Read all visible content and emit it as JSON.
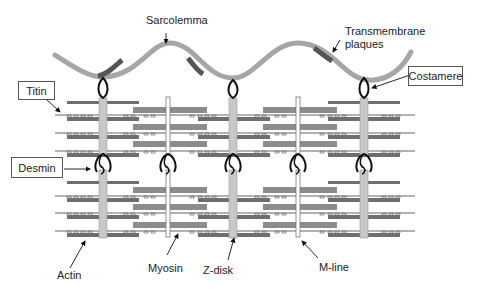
{
  "diagram": {
    "type": "muscle-sarcomere-cytoskeleton",
    "labels": {
      "sarcolemma": "Sarcolemma",
      "transmembrane": "Transmembrane",
      "plaques": "plaques",
      "costamere": "Costamere",
      "titin": "Titin",
      "desmin": "Desmin",
      "actin": "Actin",
      "myosin": "Myosin",
      "z_disk": "Z-disk",
      "m_line": "M-line"
    },
    "colors": {
      "sarcolemma": "#a6a6a6",
      "plaque": "#555555",
      "z_disk": "#c8c8c8",
      "actin": "#6e6e6e",
      "myosin": "#8c8c8c",
      "outline": "#111111"
    },
    "z_disks_x": [
      103,
      233,
      364
    ],
    "m_lines_x": [
      168,
      298
    ]
  }
}
